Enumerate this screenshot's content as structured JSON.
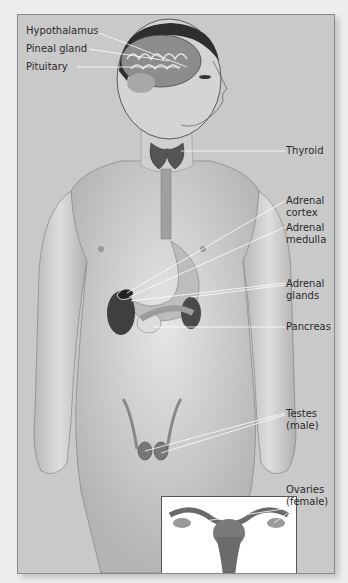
{
  "figure": {
    "colors": {
      "page_background": "#eeeeee",
      "panel_background": "#c9c9c9",
      "panel_border": "#8a8a8a",
      "skin": "#d9d9d9",
      "organ_dark": "#4a4a4a",
      "leader_line": "#ffffff",
      "label_text": "#2a2a2a"
    },
    "labels_left": [
      {
        "id": "hypothalamus",
        "text": "Hypothalamus"
      },
      {
        "id": "pineal-gland",
        "text": "Pineal gland"
      },
      {
        "id": "pituitary",
        "text": "Pituitary"
      }
    ],
    "labels_right": [
      {
        "id": "thyroid",
        "lines": [
          "Thyroid"
        ]
      },
      {
        "id": "adrenal-cortex",
        "lines": [
          "Adrenal",
          "cortex"
        ]
      },
      {
        "id": "adrenal-medulla",
        "lines": [
          "Adrenal",
          "medulla"
        ]
      },
      {
        "id": "adrenal-glands",
        "lines": [
          "Adrenal",
          "glands"
        ]
      },
      {
        "id": "pancreas",
        "lines": [
          "Pancreas"
        ]
      },
      {
        "id": "testes",
        "lines": [
          "Testes",
          "(male)"
        ]
      },
      {
        "id": "ovaries",
        "lines": [
          "Ovaries",
          "(female)"
        ]
      }
    ],
    "inset": {
      "subject": "female-reproductive-organs"
    }
  }
}
